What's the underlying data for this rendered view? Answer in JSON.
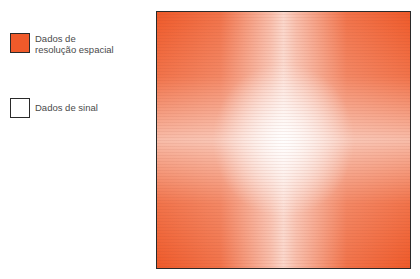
{
  "legend": {
    "items": [
      {
        "label_line1": "Dados de",
        "label_line2": "resolução espacial",
        "color": "#ef5a2a"
      },
      {
        "label": "Dados de sinal",
        "color": "#ffffff"
      }
    ]
  },
  "kspace": {
    "edge_color": "#ef5a2a",
    "center_color": "#ffffff",
    "border_color": "#2a2a2a"
  }
}
